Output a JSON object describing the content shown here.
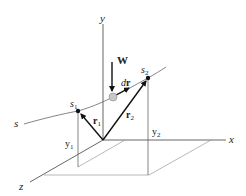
{
  "diagram": {
    "axes": {
      "x": "x",
      "y": "y",
      "z": "z"
    },
    "path_label": "s",
    "points": {
      "start": "s",
      "start_sub": "1",
      "end": "s",
      "end_sub": "2"
    },
    "vectors": {
      "r1": "r",
      "r1_sub": "1",
      "r2": "r",
      "r2_sub": "2",
      "dr_d": "d",
      "dr_r": "r"
    },
    "force": "W",
    "heights": {
      "y1": "y",
      "y1_sub": "1",
      "y2": "y",
      "y2_sub": "2"
    },
    "colors": {
      "ink": "#111111",
      "particle": "#c8c8c8"
    }
  }
}
